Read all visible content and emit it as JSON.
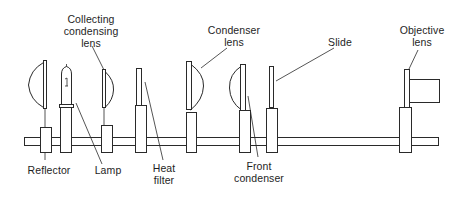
{
  "diagram": {
    "labels": {
      "reflector": [
        "Reflector"
      ],
      "lamp": [
        "Lamp"
      ],
      "collecting_condensing_lens": [
        "Collecting",
        "condensing",
        "lens"
      ],
      "heat_filter": [
        "Heat",
        "filter"
      ],
      "condenser_lens": [
        "Condenser",
        "lens"
      ],
      "front_condenser": [
        "Front",
        "condenser"
      ],
      "slide": [
        "Slide"
      ],
      "objective_lens": [
        "Objective",
        "lens"
      ]
    },
    "components_order": [
      "Reflector",
      "Lamp",
      "Collecting condensing lens",
      "Heat filter",
      "Condenser lens",
      "Front condenser",
      "Slide",
      "Objective lens"
    ],
    "colors": {
      "line": "#2a2a2a",
      "text": "#1e1e1e",
      "background": "#ffffff"
    }
  }
}
